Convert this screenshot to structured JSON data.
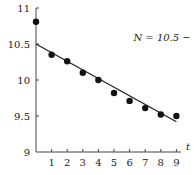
{
  "chart_data": {
    "type": "scatter",
    "title": "",
    "xlabel": "t",
    "ylabel": "",
    "xlim": [
      0,
      9.3
    ],
    "ylim": [
      9,
      11
    ],
    "x_ticks": [
      1,
      2,
      3,
      4,
      5,
      6,
      7,
      8,
      9
    ],
    "y_ticks": [
      9,
      9.5,
      10,
      10.5,
      11
    ],
    "y_tick_labels": [
      "9",
      "9.5",
      "10",
      "10.5",
      "11"
    ],
    "grid": false,
    "series": [
      {
        "name": "data",
        "type": "scatter",
        "x": [
          0,
          1,
          2,
          3,
          4,
          5,
          6,
          7,
          8,
          9
        ],
        "y": [
          10.81,
          10.35,
          10.26,
          10.1,
          10.0,
          9.82,
          9.71,
          9.61,
          9.52,
          9.5
        ]
      },
      {
        "name": "fit",
        "type": "line",
        "equation": "N = 10.5 − 0.12t",
        "x": [
          0,
          9
        ],
        "y": [
          10.5,
          9.42
        ]
      }
    ],
    "annotations": [
      {
        "text": "N = 10.5 − 0.12t",
        "x": 6.5,
        "y": 10.58
      }
    ]
  }
}
